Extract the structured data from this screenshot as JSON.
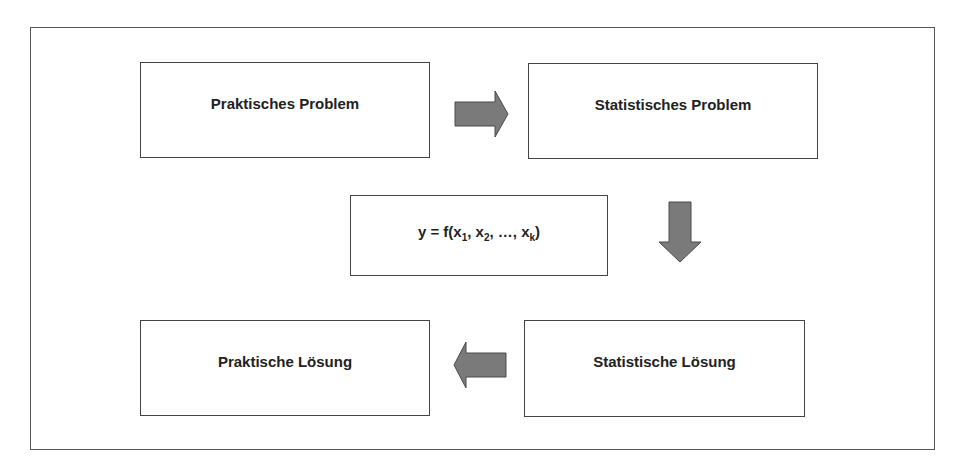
{
  "diagram": {
    "type": "flowchart",
    "language": "de",
    "nodes": [
      {
        "id": "praktisches_problem",
        "label": "Praktisches Problem"
      },
      {
        "id": "statistisches_problem",
        "label": "Statistisches Problem"
      },
      {
        "id": "modell",
        "label": "y = f(x1, x2, ..., xk)",
        "formula": {
          "lhs": "y = f(",
          "vars": [
            {
              "base": "x",
              "sub": "1",
              "sep": ", "
            },
            {
              "base": "x",
              "sub": "2",
              "sep": ", …, "
            },
            {
              "base": "x",
              "sub": "k",
              "sep": ")"
            }
          ]
        }
      },
      {
        "id": "praktische_loesung",
        "label": "Praktische Lösung"
      },
      {
        "id": "statistische_loesung",
        "label": "Statistische Lösung"
      }
    ],
    "edges": [
      {
        "from": "praktisches_problem",
        "to": "statistisches_problem",
        "direction": "right"
      },
      {
        "from": "statistisches_problem",
        "to": "statistische_loesung",
        "direction": "down"
      },
      {
        "from": "statistische_loesung",
        "to": "praktische_loesung",
        "direction": "left"
      }
    ],
    "colors": {
      "arrow_fill": "#7a7a7a",
      "arrow_stroke": "#4a4a4a",
      "border": "#444444",
      "text": "#222222"
    }
  }
}
